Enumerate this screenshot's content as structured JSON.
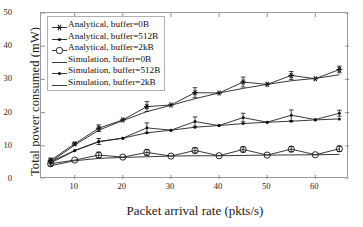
{
  "chart_data": {
    "type": "line",
    "title": "",
    "xlabel": "Packet arrival rate (pkts/s)",
    "ylabel": "Total  power consumed (mW)",
    "xlim": [
      3,
      67
    ],
    "ylim": [
      0,
      50
    ],
    "xticks": [
      10,
      20,
      30,
      40,
      50,
      60
    ],
    "yticks": [
      0,
      10,
      20,
      30,
      40,
      50
    ],
    "grid": false,
    "legend_position": "upper left",
    "x": [
      5,
      10,
      15,
      20,
      25,
      30,
      35,
      40,
      45,
      50,
      55,
      60,
      65
    ],
    "series": [
      {
        "name": "Analytical, buffer=0B",
        "marker": "star",
        "filled": true,
        "errorbars": true,
        "values": [
          5.6,
          10.6,
          15.3,
          17.8,
          21.8,
          22.3,
          26.0,
          25.9,
          29.2,
          28.5,
          31.2,
          30.2,
          33.0
        ]
      },
      {
        "name": "Analytical, buffer=512B",
        "marker": "dot",
        "filled": true,
        "errorbars": true,
        "values": [
          5.2,
          8.6,
          11.3,
          12.3,
          15.4,
          14.7,
          17.3,
          16.1,
          18.5,
          17.1,
          19.2,
          17.9,
          19.8
        ]
      },
      {
        "name": "Analytical, buffer=2kB",
        "marker": "circle",
        "filled": false,
        "errorbars": true,
        "values": [
          4.6,
          5.7,
          7.2,
          6.6,
          8.0,
          6.9,
          8.6,
          7.0,
          8.9,
          7.2,
          9.0,
          7.3,
          9.1
        ]
      },
      {
        "name": "Simulation, buffer=0B",
        "marker": "none",
        "filled": false,
        "errorbars": false,
        "values": [
          5.2,
          10.2,
          14.7,
          17.6,
          20.3,
          22.2,
          24.2,
          25.9,
          27.3,
          28.5,
          29.6,
          30.3,
          31.4
        ]
      },
      {
        "name": "Simulation, buffer=512B",
        "marker": "dot",
        "filled": true,
        "errorbars": false,
        "values": [
          4.8,
          8.5,
          11.2,
          12.3,
          13.9,
          14.7,
          15.6,
          16.1,
          16.7,
          17.1,
          17.4,
          17.8,
          18.1
        ]
      },
      {
        "name": "Simulation, buffer=2kB",
        "marker": "none",
        "filled": false,
        "errorbars": false,
        "values": [
          4.0,
          5.5,
          6.2,
          6.5,
          6.7,
          6.9,
          7.0,
          7.0,
          7.1,
          7.2,
          7.25,
          7.3,
          7.4
        ]
      }
    ],
    "errors": {
      "Analytical, buffer=0B": [
        0.7,
        0.4,
        1.0,
        0.0,
        1.5,
        0.0,
        1.5,
        0.0,
        1.5,
        0.0,
        1.2,
        0.0,
        1.0
      ],
      "Analytical, buffer=512B": [
        0.6,
        0.0,
        0.9,
        0.0,
        1.5,
        0.0,
        1.4,
        0.0,
        1.3,
        0.0,
        1.6,
        0.0,
        0.9
      ],
      "Analytical, buffer=2kB": [
        0.7,
        0.0,
        0.9,
        0.0,
        0.9,
        0.0,
        0.8,
        0.0,
        0.8,
        0.0,
        0.8,
        0.0,
        0.8
      ]
    }
  },
  "legend": {
    "items": [
      {
        "label": "Analytical, buffer=0B",
        "marker": "star-marker"
      },
      {
        "label": "Analytical, buffer=512B",
        "marker": "dot-marker"
      },
      {
        "label": "Analytical, buffer=2kB",
        "marker": "open-circle-marker"
      },
      {
        "label": "Simulation, buffer=0B",
        "marker": "line-marker"
      },
      {
        "label": "Simulation, buffer=512B",
        "marker": "dot-marker"
      },
      {
        "label": "Simulation, buffer=2kB",
        "marker": "line-marker"
      }
    ]
  },
  "axes": {
    "ytick_labels": [
      "50",
      "40",
      "30",
      "20",
      "10",
      "0"
    ],
    "xtick_labels": [
      "10",
      "20",
      "30",
      "40",
      "50",
      "60"
    ]
  },
  "colors": {
    "line": "#222222",
    "frame": "#9a9a9a",
    "text": "#1a1a1a"
  }
}
